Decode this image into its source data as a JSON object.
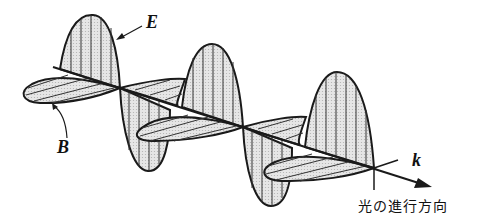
{
  "diagram": {
    "labels": {
      "electric_field": "E",
      "magnetic_field": "B",
      "wave_vector": "k",
      "direction_caption": "光の進行方向"
    },
    "colors": {
      "stroke": "#1a1a1a",
      "fill": "#d9d9d9",
      "background": "#ffffff"
    }
  }
}
